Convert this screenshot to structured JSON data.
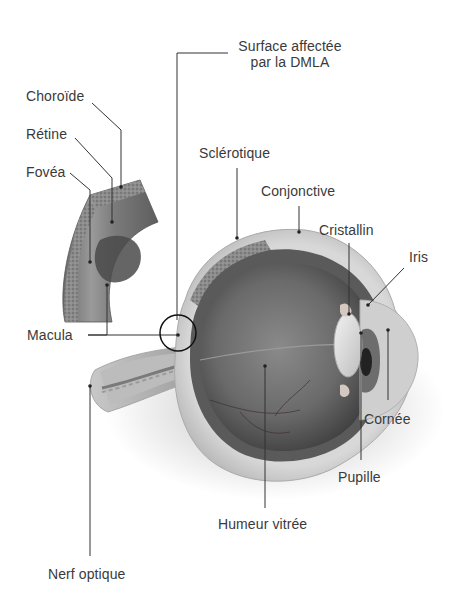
{
  "diagram": {
    "type": "labeled-anatomical-illustration",
    "colors": {
      "label_text": "#3a3a3a",
      "leader_line": "#333333",
      "background": "#ffffff"
    },
    "labels": {
      "surface_line1": "Surface affectée",
      "surface_line2": "par la DMLA",
      "choroide": "Choroïde",
      "retine": "Rétine",
      "fovea": "Fovéa",
      "sclerotique": "Sclérotique",
      "conjonctive": "Conjonctive",
      "cristallin": "Cristallin",
      "iris": "Iris",
      "macula": "Macula",
      "cornee": "Cornée",
      "pupille": "Pupille",
      "humeur_vitree": "Humeur vitrée",
      "nerf_optique": "Nerf optique"
    }
  }
}
